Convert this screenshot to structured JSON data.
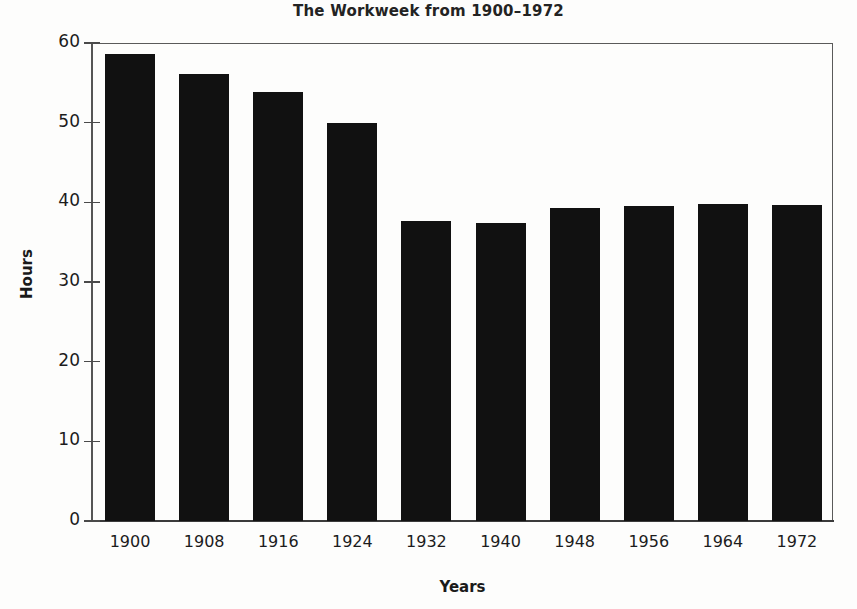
{
  "chart_data": {
    "type": "bar",
    "title": "The Workweek from 1900–1972",
    "xlabel": "Years",
    "ylabel": "Hours",
    "categories": [
      "1900",
      "1908",
      "1916",
      "1924",
      "1932",
      "1940",
      "1948",
      "1956",
      "1964",
      "1972"
    ],
    "values": [
      58.6,
      56.1,
      53.9,
      49.9,
      37.7,
      37.4,
      39.3,
      39.5,
      39.8,
      39.7
    ],
    "ylim": [
      0,
      60
    ],
    "yticks": [
      0,
      10,
      20,
      30,
      40,
      50,
      60
    ],
    "ytick_labels": [
      "0",
      "10",
      "20",
      "30",
      "40",
      "50",
      "60"
    ],
    "grid": false,
    "legend": null,
    "bar_color": "#111111",
    "axis_color": "#555555",
    "text_color": "#1c1c1c"
  }
}
